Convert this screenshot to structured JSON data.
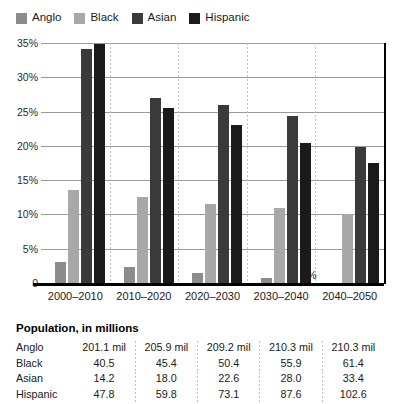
{
  "chart_data": {
    "type": "bar",
    "title": "",
    "xlabel": "",
    "ylabel": "",
    "ylim": [
      0,
      35
    ],
    "yticks": [
      "0",
      "5%",
      "10%",
      "15%",
      "20%",
      "25%",
      "30%",
      "35%"
    ],
    "ytick_values": [
      0,
      5,
      10,
      15,
      20,
      25,
      30,
      35
    ],
    "grid": true,
    "legend_position": "top-left",
    "categories": [
      "2000–2010",
      "2010–2020",
      "2020–2030",
      "2030–2040",
      "2040–2050"
    ],
    "series": [
      {
        "name": "Anglo",
        "color": "#8c8c8c",
        "values": [
          3.0,
          2.3,
          1.4,
          0.7,
          0.0
        ]
      },
      {
        "name": "Black",
        "color": "#a8a8a8",
        "values": [
          13.5,
          12.5,
          11.5,
          11.0,
          10.0
        ]
      },
      {
        "name": "Asian",
        "color": "#3a3a3a",
        "values": [
          34.2,
          27.0,
          26.0,
          24.3,
          19.8
        ]
      },
      {
        "name": "Hispanic",
        "color": "#1a1a1a",
        "values": [
          34.9,
          25.5,
          23.0,
          20.4,
          17.5
        ]
      }
    ],
    "annotations": [
      {
        "text": "0%",
        "series": "Anglo",
        "category": "2040–2050"
      }
    ]
  },
  "legend": {
    "items": [
      {
        "label": "Anglo",
        "swatch_color": "#8c8c8c",
        "icon": "square-swatch-icon"
      },
      {
        "label": "Black",
        "swatch_color": "#a8a8a8",
        "icon": "square-swatch-icon"
      },
      {
        "label": "Asian",
        "swatch_color": "#3a3a3a",
        "icon": "square-swatch-icon"
      },
      {
        "label": "Hispanic",
        "swatch_color": "#1a1a1a",
        "icon": "square-swatch-icon"
      }
    ]
  },
  "table": {
    "title": "Population, in millions",
    "columns": [
      "2000–2010",
      "2010–2020",
      "2020–2030",
      "2030–2040",
      "2040–2050"
    ],
    "rows": [
      {
        "label": "Anglo",
        "values": [
          "201.1 mil",
          "205.9 mil",
          "209.2 mil",
          "210.3 mil",
          "210.3 mil"
        ]
      },
      {
        "label": "Black",
        "values": [
          "40.5",
          "45.4",
          "50.4",
          "55.9",
          "61.4"
        ]
      },
      {
        "label": "Asian",
        "values": [
          "14.2",
          "18.0",
          "22.6",
          "28.0",
          "33.4"
        ]
      },
      {
        "label": "Hispanic",
        "values": [
          "47.8",
          "59.8",
          "73.1",
          "87.6",
          "102.6"
        ]
      }
    ]
  }
}
